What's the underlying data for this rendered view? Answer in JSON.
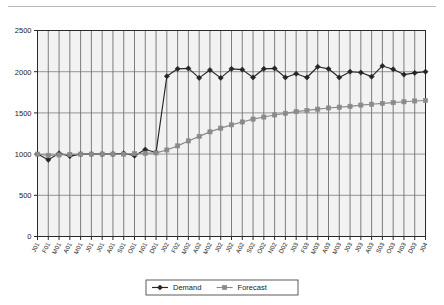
{
  "page": {
    "clipped_top_text": "",
    "background_color": "#ffffff"
  },
  "chart_data": {
    "type": "line",
    "title": "",
    "subtitle": "",
    "xlabel": "",
    "ylabel": "",
    "ylim": [
      0,
      2500
    ],
    "yticks": [
      0,
      500,
      1000,
      1500,
      2000,
      2500
    ],
    "ytick_labels": [
      "0",
      "500",
      "1000",
      "1500",
      "2000",
      "2500"
    ],
    "grid": true,
    "grid_vertical": true,
    "grid_horizontal": true,
    "legend_position": "bottom",
    "x": [
      "J01",
      "F01",
      "M01",
      "A01",
      "M01",
      "J01",
      "J01",
      "A01",
      "S01",
      "O01",
      "N01",
      "D01",
      "J02",
      "F02",
      "M02",
      "A02",
      "M02",
      "J02",
      "J02",
      "A02",
      "S02",
      "O02",
      "N02",
      "D02",
      "J03",
      "F03",
      "M03",
      "A03",
      "M03",
      "J03",
      "J03",
      "A03",
      "S03",
      "O03",
      "N03",
      "D03",
      "J04"
    ],
    "series": [
      {
        "name": "Demand",
        "color": "#262626",
        "marker": "diamond",
        "values": [
          1000,
          930,
          1010,
          975,
          1000,
          1000,
          1000,
          1000,
          1010,
          980,
          1055,
          1020,
          1945,
          2035,
          2040,
          1925,
          2020,
          1925,
          2035,
          2025,
          1930,
          2035,
          2040,
          1930,
          1975,
          1930,
          2060,
          2035,
          1930,
          2000,
          1990,
          1940,
          2070,
          2030,
          1965,
          1985,
          2000
        ]
      },
      {
        "name": "Forecast",
        "color": "#8a8a8a",
        "marker": "square",
        "values": [
          1000,
          985,
          990,
          995,
          1000,
          1000,
          1000,
          1000,
          1000,
          1005,
          1010,
          1015,
          1050,
          1100,
          1160,
          1215,
          1270,
          1315,
          1355,
          1390,
          1425,
          1450,
          1475,
          1495,
          1515,
          1530,
          1545,
          1560,
          1570,
          1580,
          1595,
          1605,
          1615,
          1625,
          1635,
          1645,
          1650
        ]
      }
    ]
  },
  "legend": {
    "items": [
      {
        "label": "Demand",
        "marker": "diamond",
        "color": "#262626"
      },
      {
        "label": "Forecast",
        "marker": "square",
        "color": "#8a8a8a"
      }
    ]
  }
}
